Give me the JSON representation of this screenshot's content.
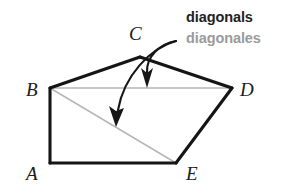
{
  "figure": {
    "canvas": {
      "width": 296,
      "height": 189
    },
    "background_color": "#ffffff"
  },
  "callout": {
    "primary_label": "diagonals",
    "primary_color": "#222222",
    "secondary_label": "diagonales",
    "secondary_color": "#9a9a9a"
  },
  "polygon": {
    "name": "ABCDE",
    "edge_color": "#151515",
    "edge_width": 3.1,
    "vertices": [
      {
        "id": "A",
        "label": "A",
        "x": 50,
        "y": 163,
        "label_x": 26,
        "label_y": 180
      },
      {
        "id": "B",
        "label": "B",
        "x": 50,
        "y": 88,
        "label_x": 26,
        "label_y": 96
      },
      {
        "id": "C",
        "label": "C",
        "x": 140,
        "y": 57,
        "label_x": 129,
        "label_y": 40
      },
      {
        "id": "D",
        "label": "D",
        "x": 232,
        "y": 88,
        "label_x": 240,
        "label_y": 96
      },
      {
        "id": "E",
        "label": "E",
        "x": 176,
        "y": 163,
        "label_x": 186,
        "label_y": 180
      }
    ],
    "edges": [
      {
        "from": "A",
        "to": "B"
      },
      {
        "from": "B",
        "to": "C"
      },
      {
        "from": "C",
        "to": "D"
      },
      {
        "from": "D",
        "to": "E"
      },
      {
        "from": "E",
        "to": "A"
      }
    ]
  },
  "diagonals": {
    "color": "#b6b6b6",
    "width": 1.5,
    "segments": [
      {
        "id": "BD",
        "from": "B",
        "to": "D",
        "x1": 50,
        "y1": 88,
        "x2": 232,
        "y2": 88
      },
      {
        "id": "BE",
        "from": "B",
        "to": "E",
        "x1": 50,
        "y1": 88,
        "x2": 176,
        "y2": 163
      }
    ]
  },
  "arrows": {
    "color": "#161616",
    "origin_x": 176,
    "origin_y": 41,
    "items": [
      {
        "id": "arrow-to-bd",
        "target_diagonal": "BD",
        "path": "M 176 41 C 160 44 146 56 147 73",
        "head": "147,88 142,70 147,74 152,70",
        "tip_x": 147,
        "tip_y": 88
      },
      {
        "id": "arrow-to-be",
        "target_diagonal": "BE",
        "path": "M 176 41 C 150 48 124 76 118 110",
        "head": "116,126 110,107 116,111 123,109",
        "tip_x": 116,
        "tip_y": 126
      }
    ]
  }
}
